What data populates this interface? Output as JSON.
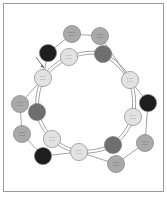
{
  "diagram": {
    "title": "",
    "colors": {
      "border": "#9a9a9a",
      "line": "#8a8a8a",
      "black": "#1e1e1e",
      "dark": "#6f6f6f",
      "mid": "#a9a9a9",
      "light": "#e2e2e2",
      "node_stroke": "#777777"
    },
    "nodes": [
      {
        "id": "n1",
        "x": 72,
        "y": 34,
        "shade": "mid",
        "ring": "outer"
      },
      {
        "id": "n2",
        "x": 100,
        "y": 36,
        "shade": "mid",
        "ring": "outer"
      },
      {
        "id": "n3",
        "x": 48,
        "y": 53,
        "shade": "black",
        "ring": "outer"
      },
      {
        "id": "n4",
        "x": 69,
        "y": 57,
        "shade": "light",
        "ring": "inner"
      },
      {
        "id": "n5",
        "x": 103,
        "y": 54,
        "shade": "dark",
        "ring": "inner"
      },
      {
        "id": "n6",
        "x": 43,
        "y": 78,
        "shade": "light",
        "ring": "both"
      },
      {
        "id": "n7",
        "x": 130,
        "y": 80,
        "shade": "light",
        "ring": "both"
      },
      {
        "id": "n8",
        "x": 148,
        "y": 103,
        "shade": "black",
        "ring": "outer"
      },
      {
        "id": "n9",
        "x": 20,
        "y": 104,
        "shade": "mid",
        "ring": "outer"
      },
      {
        "id": "n10",
        "x": 37,
        "y": 112,
        "shade": "dark",
        "ring": "inner"
      },
      {
        "id": "n11",
        "x": 133,
        "y": 117,
        "shade": "light",
        "ring": "inner"
      },
      {
        "id": "n12",
        "x": 22,
        "y": 134,
        "shade": "mid",
        "ring": "outer"
      },
      {
        "id": "n13",
        "x": 52,
        "y": 139,
        "shade": "light",
        "ring": "inner"
      },
      {
        "id": "n14",
        "x": 113,
        "y": 145,
        "shade": "dark",
        "ring": "inner"
      },
      {
        "id": "n15",
        "x": 145,
        "y": 143,
        "shade": "mid",
        "ring": "outer"
      },
      {
        "id": "n16",
        "x": 79,
        "y": 152,
        "shade": "light",
        "ring": "inner"
      },
      {
        "id": "n17",
        "x": 43,
        "y": 156,
        "shade": "black",
        "ring": "outer"
      },
      {
        "id": "n18",
        "x": 116,
        "y": 164,
        "shade": "mid",
        "ring": "outer"
      }
    ],
    "outer_path": [
      "n1",
      "n2",
      "n7",
      "n8",
      "n15",
      "n18",
      "n16",
      "n17",
      "n12",
      "n9",
      "n6",
      "n3",
      "n1"
    ],
    "inner_path": [
      "n4",
      "n5",
      "n7",
      "n11",
      "n14",
      "n16",
      "n13",
      "n10",
      "n6",
      "n4"
    ],
    "arrow": {
      "x1": 36,
      "y1": 57,
      "x2": 44,
      "y2": 68
    }
  }
}
